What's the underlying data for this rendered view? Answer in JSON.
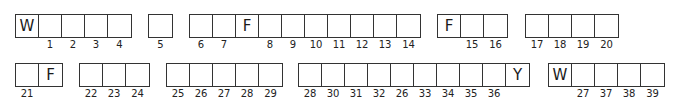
{
  "diagram": {
    "line_color": "#333333",
    "rows": [
      {
        "groups": [
          {
            "x": 15,
            "y": 14,
            "cells": [
              {
                "letter": "W",
                "label": ""
              },
              {
                "letter": "",
                "label": "1"
              },
              {
                "letter": "",
                "label": "2"
              },
              {
                "letter": "",
                "label": "3"
              },
              {
                "letter": "",
                "label": "4"
              }
            ]
          },
          {
            "x": 148,
            "y": 14,
            "cells": [
              {
                "letter": "",
                "label": "5"
              }
            ]
          },
          {
            "x": 189,
            "y": 14,
            "cells": [
              {
                "letter": "",
                "label": "6"
              },
              {
                "letter": "",
                "label": "7"
              },
              {
                "letter": "F",
                "label": ""
              },
              {
                "letter": "",
                "label": "8"
              },
              {
                "letter": "",
                "label": "9"
              },
              {
                "letter": "",
                "label": "10"
              },
              {
                "letter": "",
                "label": "11"
              },
              {
                "letter": "",
                "label": "12"
              },
              {
                "letter": "",
                "label": "13"
              },
              {
                "letter": "",
                "label": "14"
              }
            ]
          },
          {
            "x": 437,
            "y": 14,
            "cells": [
              {
                "letter": "F",
                "label": ""
              },
              {
                "letter": "",
                "label": "15"
              },
              {
                "letter": "",
                "label": "16"
              }
            ]
          },
          {
            "x": 525,
            "y": 14,
            "cells": [
              {
                "letter": "",
                "label": "17"
              },
              {
                "letter": "",
                "label": "18"
              },
              {
                "letter": "",
                "label": "19"
              },
              {
                "letter": "",
                "label": "20"
              }
            ]
          }
        ]
      },
      {
        "groups": [
          {
            "x": 15,
            "y": 63,
            "cells": [
              {
                "letter": "",
                "label": "21"
              },
              {
                "letter": "F",
                "label": ""
              }
            ]
          },
          {
            "x": 79,
            "y": 63,
            "cells": [
              {
                "letter": "",
                "label": "22"
              },
              {
                "letter": "",
                "label": "23"
              },
              {
                "letter": "",
                "label": "24"
              }
            ]
          },
          {
            "x": 166,
            "y": 63,
            "cells": [
              {
                "letter": "",
                "label": "25"
              },
              {
                "letter": "",
                "label": "26"
              },
              {
                "letter": "",
                "label": "27"
              },
              {
                "letter": "",
                "label": "28"
              },
              {
                "letter": "",
                "label": "29"
              }
            ]
          },
          {
            "x": 298,
            "y": 63,
            "cells": [
              {
                "letter": "",
                "label": "28"
              },
              {
                "letter": "",
                "label": "30"
              },
              {
                "letter": "",
                "label": "31"
              },
              {
                "letter": "",
                "label": "32"
              },
              {
                "letter": "",
                "label": "26"
              },
              {
                "letter": "",
                "label": "33"
              },
              {
                "letter": "",
                "label": "34"
              },
              {
                "letter": "",
                "label": "35"
              },
              {
                "letter": "",
                "label": "36"
              },
              {
                "letter": "Y",
                "label": ""
              }
            ]
          },
          {
            "x": 548,
            "y": 63,
            "cells": [
              {
                "letter": "W",
                "label": ""
              },
              {
                "letter": "",
                "label": "27"
              },
              {
                "letter": "",
                "label": "37"
              },
              {
                "letter": "",
                "label": "38"
              },
              {
                "letter": "",
                "label": "39"
              }
            ]
          }
        ]
      }
    ]
  }
}
